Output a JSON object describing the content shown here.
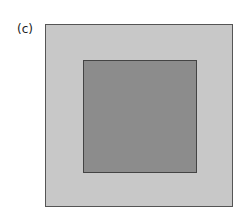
{
  "figure": {
    "label": "(c)",
    "outer_square": {
      "fill": "#c8c8c8",
      "border": "#555555"
    },
    "inner_square": {
      "fill": "#8c8c8c",
      "border": "#444444"
    }
  }
}
